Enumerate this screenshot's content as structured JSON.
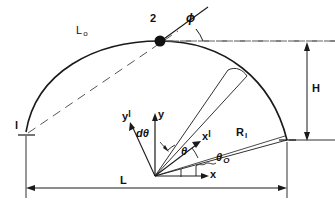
{
  "figure": {
    "type": "engineering-geometry-diagram",
    "stroke_color": "#1a1a1a",
    "background_color": "#ffffff",
    "dash_color": "#555555"
  },
  "labels": {
    "arc_length": "L",
    "arc_length_sub": "o",
    "point_two": "2",
    "point_one": "l",
    "tangent_angle": "ϕ",
    "height": "H",
    "radius": "R",
    "radius_sub": "l",
    "span": "L",
    "axis_x": "x",
    "axis_y": "y",
    "axis_x_prime": "x",
    "axis_x_prime_sup": "l",
    "axis_y_prime": "y",
    "axis_y_prime_sup": "l",
    "theta": "θ",
    "theta_zero": "θ",
    "theta_zero_sub": "O",
    "d_theta": "dθ"
  },
  "geometry": {
    "origin": {
      "x": 155,
      "y": 176
    },
    "arc_left_end": {
      "x": 26,
      "y": 132
    },
    "arc_apex": {
      "x": 160,
      "y": 41
    },
    "arc_right_end": {
      "x": 287,
      "y": 140
    },
    "span_dimension": {
      "x1": 26,
      "x2": 287,
      "y": 188
    },
    "height_dimension": {
      "x": 307,
      "y1": 46,
      "y2": 140
    }
  }
}
